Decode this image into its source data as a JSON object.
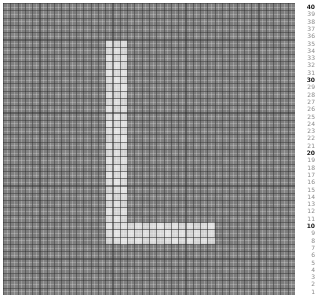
{
  "chart_data": {
    "type": "heatmap",
    "title": "",
    "subtitle": "",
    "xlabel": "",
    "ylabel": "",
    "grid": true,
    "legend": "none",
    "axis_position": "right",
    "rows": 40,
    "cols": 40,
    "xlim": [
      1,
      40
    ],
    "ylim": [
      1,
      40
    ],
    "background_value": 0.0,
    "highlight_value": 1.0,
    "colors": {
      "background_cell": "#808080",
      "highlight_cell": "#d9d9d9",
      "grid_major": "#282828",
      "grid_minor": "#ffffff",
      "axis_label": "#8a8a8a",
      "axis_label_major": "#1a1a1a",
      "page_background": "#ffffff"
    },
    "shape_description": "L",
    "highlight_regions": [
      {
        "name": "vertical-stem",
        "col_start": 15,
        "col_end": 17,
        "row_start": 8,
        "row_end": 35
      },
      {
        "name": "horizontal-foot",
        "col_start": 15,
        "col_end": 29,
        "row_start": 8,
        "row_end": 10
      }
    ],
    "y_tick_labels": [
      "40",
      "39",
      "38",
      "37",
      "36",
      "35",
      "34",
      "33",
      "32",
      "31",
      "30",
      "29",
      "28",
      "27",
      "26",
      "25",
      "24",
      "23",
      "22",
      "21",
      "20",
      "19",
      "18",
      "17",
      "16",
      "15",
      "14",
      "13",
      "12",
      "11",
      "10",
      "9",
      "8",
      "7",
      "6",
      "5",
      "4",
      "3",
      "2",
      "1"
    ],
    "y_major_ticks": [
      "40",
      "30",
      "20",
      "10"
    ],
    "x_tick_labels": [],
    "annotations": []
  },
  "plot": {
    "name": "grid-heatmap"
  }
}
